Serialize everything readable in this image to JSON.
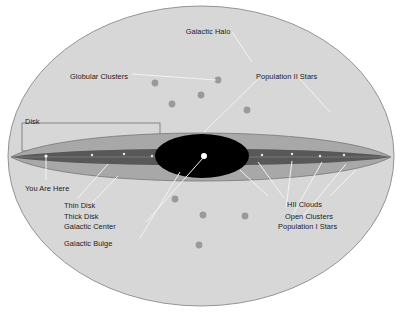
{
  "figure": {
    "type": "astronomy-schematic",
    "background_color": "#ffffff",
    "halo_fill": "#d7d7d7",
    "halo_stroke": "#8a8a8a",
    "thick_disk_fill": "#a8a8a8",
    "thin_disk_fill": "#585858",
    "bulge_fill": "#000000",
    "center_dot_fill": "#ffffff",
    "cluster_dot_fill": "#9a9a9a",
    "leader_line_color": "#ffffff",
    "disk_box_stroke": "#6f6f6f"
  },
  "labels": {
    "galactic_halo": "Galactic Halo",
    "globular_clusters": "Globular Clusters",
    "population_ii_stars": "Population II Stars",
    "disk": "Disk",
    "you_are_here": "You Are Here",
    "thin_disk": "Thin Disk",
    "thick_disk": "Thick Disk",
    "galactic_center": "Galactic Center",
    "galactic_bulge": "Galactic Bulge",
    "hii_clouds": "HII Clouds",
    "open_clusters": "Open Clusters",
    "population_i_stars": "Population I Stars"
  },
  "structures": [
    {
      "name": "galactic-halo",
      "label": "Galactic Halo",
      "shape": "ellipse",
      "cx": 201,
      "cy": 156,
      "rx": 193,
      "ry": 150
    },
    {
      "name": "thick-disk",
      "label": "Thick Disk",
      "shape": "lens",
      "cx": 201,
      "cy": 157,
      "rx": 190,
      "ry": 26
    },
    {
      "name": "thin-disk",
      "label": "Thin Disk",
      "shape": "lens",
      "cx": 201,
      "cy": 157,
      "rx": 190,
      "ry": 8
    },
    {
      "name": "galactic-bulge",
      "label": "Galactic Bulge",
      "shape": "ellipse",
      "cx": 202,
      "cy": 156,
      "rx": 47,
      "ry": 22
    },
    {
      "name": "galactic-center",
      "label": "Galactic Center",
      "shape": "dot",
      "cx": 204,
      "cy": 156,
      "r": 3
    },
    {
      "name": "sun-position",
      "label": "You Are Here",
      "shape": "marker",
      "cx": 46,
      "cy": 157
    }
  ],
  "globular_clusters": [
    {
      "cx": 155,
      "cy": 83,
      "r": 3.4
    },
    {
      "cx": 218,
      "cy": 80,
      "r": 3.4
    },
    {
      "cx": 201,
      "cy": 95,
      "r": 3.4
    },
    {
      "cx": 172,
      "cy": 104,
      "r": 3.4
    },
    {
      "cx": 247,
      "cy": 110,
      "r": 3.4
    },
    {
      "cx": 175,
      "cy": 199,
      "r": 3.4
    },
    {
      "cx": 203,
      "cy": 215,
      "r": 3.4
    },
    {
      "cx": 245,
      "cy": 216,
      "r": 3.4
    },
    {
      "cx": 199,
      "cy": 245,
      "r": 3.4
    }
  ],
  "label_positions": {
    "galactic_halo": {
      "x": 208,
      "y": 27,
      "align": "center"
    },
    "globular_clusters": {
      "x": 70,
      "y": 72,
      "align": "left"
    },
    "population_ii_stars": {
      "x": 256,
      "y": 72,
      "align": "left"
    },
    "disk": {
      "x": 25,
      "y": 117,
      "align": "left"
    },
    "you_are_here": {
      "x": 25,
      "y": 184,
      "align": "left"
    },
    "thin_disk": {
      "x": 64,
      "y": 201,
      "align": "left"
    },
    "thick_disk": {
      "x": 64,
      "y": 212,
      "align": "left"
    },
    "galactic_center": {
      "x": 64,
      "y": 222,
      "align": "left"
    },
    "galactic_bulge": {
      "x": 64,
      "y": 239,
      "align": "left"
    },
    "hii_clouds": {
      "x": 287,
      "y": 200,
      "align": "left"
    },
    "open_clusters": {
      "x": 285,
      "y": 212,
      "align": "left"
    },
    "population_i_stars": {
      "x": 278,
      "y": 222,
      "align": "left"
    }
  }
}
